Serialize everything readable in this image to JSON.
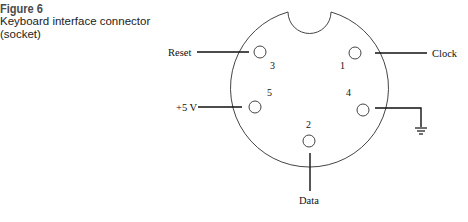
{
  "figure": {
    "number": "Figure 6",
    "title_line1": "Keyboard interface connector",
    "title_line2": "(socket)"
  },
  "diagram": {
    "connector_type": "5-pin DIN socket",
    "pins": [
      {
        "number": "1",
        "signal": "Clock"
      },
      {
        "number": "2",
        "signal": "Data"
      },
      {
        "number": "3",
        "signal": "Reset"
      },
      {
        "number": "4",
        "signal": "Ground"
      },
      {
        "number": "5",
        "signal": "+5 V"
      }
    ],
    "labels": {
      "reset": "Reset",
      "clock": "Clock",
      "vcc": "+5 V",
      "data": "Data"
    },
    "colors": {
      "outline": "#444444",
      "lines": "#111111",
      "caption_number": "#4a4a4a"
    }
  }
}
